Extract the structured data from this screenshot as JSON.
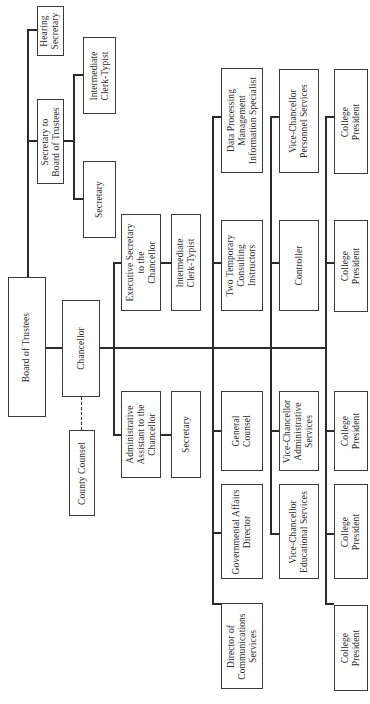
{
  "chart_title": "",
  "orientation": "rotated-90-ccw",
  "nodes": {
    "hearing_secretary": "Hearing\nSecretary",
    "secretary_to_board": "Secretary to\nBoard of Trustees",
    "board_intermediate_clerk": "Intermediate\nClerk-Typist",
    "board_secretary": "Secretary",
    "board_of_trustees": "Board of Trustees",
    "chancellor": "Chancellor",
    "county_counsel": "County Counsel",
    "executive_secretary": "Executive Secretary\nto the\nChancellor",
    "exec_intermediate_clerk": "Intermediate\nClerk-Typist",
    "admin_assistant": "Administrative\nAssistant to the\nChancellor",
    "admin_secretary": "Secretary",
    "data_processing": "Data Processing\nManagement\nInformation Specialist",
    "two_temporary": "Two Temporary\nConsulting\nInstructors",
    "general_counsel": "General\nCounsel",
    "governmental_affairs": "Governmental Affairs\nDirector",
    "director_communications": "Director of\nCommunications\nServices",
    "vc_personnel": "Vice-Chancellor\nPersonnel Services",
    "controller": "Controller",
    "vc_administrative": "Vice-Chancellor\nAdministrative\nServices",
    "vc_educational": "Vice-Chancellor\nEducational Services",
    "college_president_1": "College\nPresident",
    "college_president_2": "College\nPresident",
    "college_president_3": "College\nPresident",
    "college_president_4": "College\nPresident",
    "college_president_5": "College\nPresident"
  }
}
